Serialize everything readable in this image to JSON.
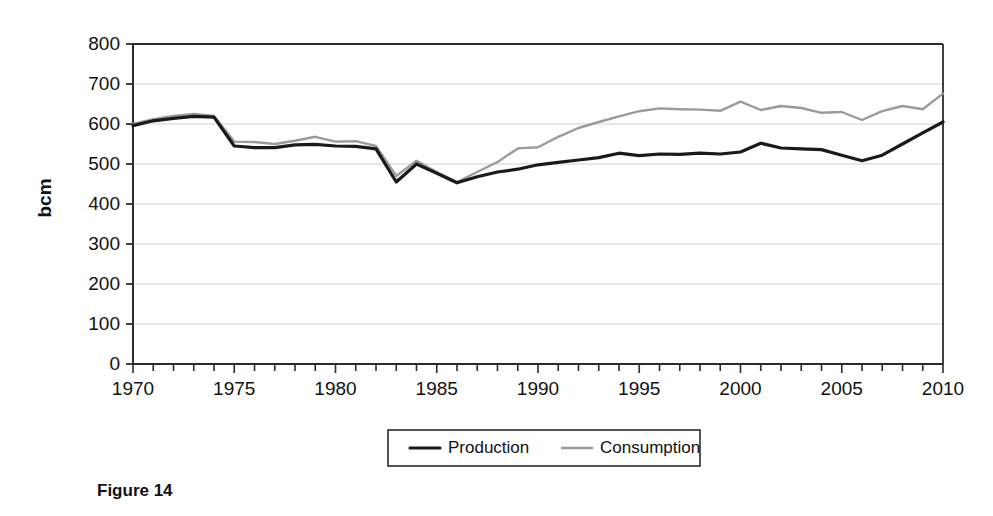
{
  "figure": {
    "caption": "Figure 14",
    "y_axis_title": "bcm"
  },
  "legend": {
    "position": "bottom-center",
    "items": [
      {
        "label": "Production",
        "color": "#1a1a1a",
        "width": 3.2
      },
      {
        "label": "Consumption",
        "color": "#9a9a9a",
        "width": 2.4
      }
    ]
  },
  "chart_data": {
    "type": "line",
    "title": "",
    "subtitle": "",
    "xlabel": "",
    "ylabel": "bcm",
    "xlim": [
      1970,
      2010
    ],
    "ylim": [
      0,
      800
    ],
    "grid": "horizontal",
    "x_major_tick_labels": [
      "1970",
      "1975",
      "1980",
      "1985",
      "1990",
      "1995",
      "2000",
      "2005",
      "2010"
    ],
    "x_minor_tick_interval": 1,
    "y_tick_labels": [
      "0",
      "100",
      "200",
      "300",
      "400",
      "500",
      "600",
      "700",
      "800"
    ],
    "y_tick_interval": 100,
    "x": [
      1970,
      1971,
      1972,
      1973,
      1974,
      1975,
      1976,
      1977,
      1978,
      1979,
      1980,
      1981,
      1982,
      1983,
      1984,
      1985,
      1986,
      1987,
      1988,
      1989,
      1990,
      1991,
      1992,
      1993,
      1994,
      1995,
      1996,
      1997,
      1998,
      1999,
      2000,
      2001,
      2002,
      2003,
      2004,
      2005,
      2006,
      2007,
      2008,
      2009,
      2010
    ],
    "series": [
      {
        "name": "Production",
        "color": "#1a1a1a",
        "values": [
          596,
          608,
          614,
          619,
          617,
          545,
          541,
          541,
          548,
          549,
          545,
          544,
          538,
          455,
          500,
          477,
          453,
          468,
          480,
          487,
          498,
          504,
          510,
          516,
          527,
          521,
          525,
          524,
          527,
          525,
          530,
          552,
          540,
          538,
          536,
          522,
          508,
          522,
          550,
          578,
          605
        ]
      },
      {
        "name": "Consumption",
        "color": "#9a9a9a",
        "values": [
          600,
          612,
          620,
          625,
          620,
          556,
          555,
          550,
          558,
          568,
          556,
          557,
          545,
          470,
          508,
          480,
          455,
          480,
          505,
          539,
          542,
          568,
          590,
          605,
          619,
          632,
          639,
          637,
          636,
          633,
          656,
          635,
          645,
          640,
          628,
          630,
          610,
          632,
          645,
          637,
          676
        ]
      }
    ]
  },
  "axes_geometry": {
    "plot_left": 133,
    "plot_right": 943,
    "plot_top": 44,
    "plot_bottom": 364
  }
}
